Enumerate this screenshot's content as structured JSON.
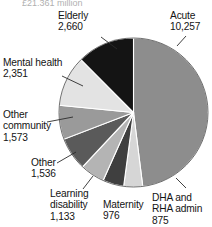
{
  "figure": {
    "partial_caption_top": "£21,361 million",
    "caption_visible": "partially cropped at top edge"
  },
  "chart_data": {
    "type": "pie",
    "title": "",
    "xlabel": "",
    "ylabel": "",
    "legend_position": "none",
    "grid": false,
    "labels_outside": true,
    "total": 21361,
    "categories": [
      "Acute",
      "DHA and RHA admin",
      "Maternity",
      "Learning disability",
      "Other",
      "Other community",
      "Mental health",
      "Elderly"
    ],
    "values": [
      10257,
      875,
      976,
      1133,
      1536,
      1573,
      2351,
      2660
    ],
    "value_labels": [
      "10,257",
      "875",
      "976",
      "1,133",
      "1,536",
      "1,573",
      "2,351",
      "2,660"
    ],
    "slice_colors": [
      "#8d8d8d",
      "#d6d6d6",
      "#3f3f3f",
      "#b4b4b4",
      "#5a5a5a",
      "#9a9a9a",
      "#e3e3e3",
      "#141414"
    ],
    "start_angle_deg": 0,
    "direction": "clockwise"
  },
  "labels": {
    "acute": {
      "name": "Acute",
      "value": "10,257"
    },
    "dha_rha_admin": {
      "line1": "DHA and",
      "line2": "RHA admin",
      "value": "875"
    },
    "maternity": {
      "name": "Maternity",
      "value": "976"
    },
    "learning_disability": {
      "line1": "Learning",
      "line2": "disability",
      "value": "1,133"
    },
    "other": {
      "name": "Other",
      "value": "1,536"
    },
    "other_community": {
      "line1": "Other",
      "line2": "community",
      "value": "1,573"
    },
    "mental_health": {
      "name": "Mental health",
      "value": "2,351"
    },
    "elderly": {
      "name": "Elderly",
      "value": "2,660"
    }
  }
}
